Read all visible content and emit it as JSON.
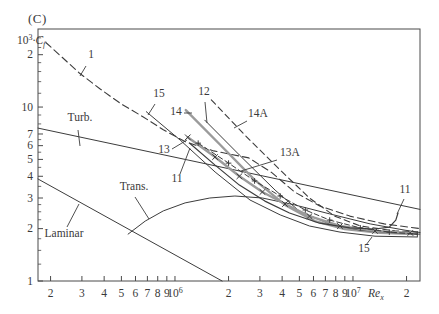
{
  "figure": {
    "corner_label": "(C)"
  },
  "chart_data": {
    "type": "line",
    "xlabel_parts": {
      "var": "Re",
      "sub": "x"
    },
    "ylabel_parts": {
      "pre": "10",
      "sup": "3",
      "mid": "·",
      "var": "C",
      "sub": "f"
    },
    "x_axis": {
      "scale": "log",
      "lim": [
        170000,
        23800000
      ],
      "ticks": [
        {
          "v": 200000,
          "label": "2"
        },
        {
          "v": 300000,
          "label": "3"
        },
        {
          "v": 400000,
          "label": "4"
        },
        {
          "v": 500000,
          "label": "5"
        },
        {
          "v": 600000,
          "label": "6"
        },
        {
          "v": 700000,
          "label": "7"
        },
        {
          "v": 800000,
          "label": "8"
        },
        {
          "v": 900000,
          "label": "9"
        },
        {
          "v": 1000000,
          "label": {
            "base": "10",
            "exp": "6"
          }
        },
        {
          "v": 2000000,
          "label": "2"
        },
        {
          "v": 3000000,
          "label": "3"
        },
        {
          "v": 4000000,
          "label": "4"
        },
        {
          "v": 5000000,
          "label": "5"
        },
        {
          "v": 6000000,
          "label": "6"
        },
        {
          "v": 7000000,
          "label": "7"
        },
        {
          "v": 8000000,
          "label": "8"
        },
        {
          "v": 9000000,
          "label": "9"
        },
        {
          "v": 10000000,
          "label": {
            "base": "10",
            "exp": "7"
          }
        },
        {
          "v": 20000000,
          "label": "2"
        }
      ]
    },
    "y_axis": {
      "scale": "log",
      "lim": [
        1,
        28.1
      ],
      "ticks": [
        {
          "v": 20,
          "label": "2"
        },
        {
          "v": 10,
          "label": "10"
        },
        {
          "v": 7,
          "label": "7"
        },
        {
          "v": 6,
          "label": "6"
        },
        {
          "v": 5,
          "label": "5"
        },
        {
          "v": 4,
          "label": "4"
        },
        {
          "v": 3,
          "label": "3"
        },
        {
          "v": 2,
          "label": "2"
        },
        {
          "v": 1,
          "label": "1"
        }
      ],
      "minor_ticks": [
        1.25,
        1.5,
        1.75,
        2.25,
        2.5,
        2.75,
        3.5,
        4.5,
        5.5,
        6.5,
        8,
        9,
        12,
        14,
        16,
        18,
        22,
        25
      ]
    },
    "colors": {
      "line": "#3c3c3c",
      "gray_line": "#9b9b9b",
      "text": "#3a3a3a",
      "frame": "#4a4a4a",
      "background": "#ffffff"
    },
    "series": [
      {
        "id": "1",
        "label": "1",
        "style": "dashed",
        "width": 1.1,
        "color": "line",
        "marker": null,
        "points": [
          [
            188000,
            23.5
          ],
          [
            230000,
            19.5
          ],
          [
            290000,
            15.7
          ],
          [
            380000,
            12.7
          ],
          [
            500000,
            10.4
          ],
          [
            660000,
            8.8
          ],
          [
            860000,
            7.4
          ],
          [
            1150000,
            6.3
          ],
          [
            1650000,
            5.6
          ],
          [
            2600000,
            5.1
          ],
          [
            3500000,
            4.2
          ],
          [
            4700000,
            3.25
          ],
          [
            6500000,
            2.7
          ],
          [
            9600000,
            2.36
          ],
          [
            15000000,
            2.13
          ],
          [
            23800000,
            2.0
          ]
        ]
      },
      {
        "id": "turb",
        "label": "Turb.",
        "style": "solid",
        "width": 1.0,
        "color": "line",
        "marker": null,
        "points": [
          [
            170000,
            7.57
          ],
          [
            23800000,
            2.58
          ]
        ]
      },
      {
        "id": "laminar",
        "label": "Laminar",
        "style": "solid",
        "width": 1.0,
        "color": "line",
        "marker": null,
        "points": [
          [
            170000,
            3.86
          ],
          [
            1840000,
            1.0
          ]
        ]
      },
      {
        "id": "trans",
        "label": "Trans.",
        "style": "solid",
        "width": 1.0,
        "color": "line",
        "marker": null,
        "points": [
          [
            545000,
            1.86
          ],
          [
            680000,
            2.21
          ],
          [
            860000,
            2.53
          ],
          [
            1140000,
            2.81
          ],
          [
            1570000,
            3.0
          ],
          [
            2170000,
            3.08
          ],
          [
            3100000,
            3.0
          ],
          [
            4700000,
            2.74
          ],
          [
            7400000,
            2.43
          ],
          [
            12500000,
            2.13
          ],
          [
            19600000,
            1.96
          ],
          [
            23800000,
            1.9
          ]
        ]
      },
      {
        "id": "15",
        "label": "15",
        "style": "solid",
        "width": 1.0,
        "color": "line",
        "marker": null,
        "points": [
          [
            690000,
            9.4
          ],
          [
            1070000,
            6.46
          ],
          [
            1680000,
            4.23
          ],
          [
            2640000,
            2.92
          ],
          [
            3900000,
            2.4
          ],
          [
            5700000,
            2.07
          ],
          [
            8450000,
            1.91
          ],
          [
            13300000,
            1.81
          ],
          [
            23000000,
            1.79
          ]
        ]
      },
      {
        "id": "14",
        "label": "14",
        "style": "solid",
        "width": 2.4,
        "color": "gray_line",
        "marker": null,
        "points": [
          [
            1150000,
            9.6
          ],
          [
            1800000,
            6.05
          ],
          [
            2800000,
            3.81
          ],
          [
            4150000,
            2.74
          ],
          [
            6100000,
            2.21
          ],
          [
            9000000,
            1.99
          ],
          [
            14200000,
            1.89
          ],
          [
            22000000,
            1.86
          ]
        ]
      },
      {
        "id": "12",
        "label": "12",
        "style": "solid",
        "width": 1.0,
        "color": "line",
        "marker": null,
        "points": [
          [
            1470000,
            8.4
          ],
          [
            2300000,
            5.3
          ],
          [
            3650000,
            3.33
          ],
          [
            5000000,
            2.52
          ],
          [
            7400000,
            2.13
          ],
          [
            11000000,
            1.96
          ],
          [
            17200000,
            1.89
          ],
          [
            23000000,
            1.86
          ]
        ]
      },
      {
        "id": "14A",
        "label": "14A",
        "style": "dashed",
        "width": 1.1,
        "color": "line",
        "marker": null,
        "points": [
          [
            1600000,
            11.0
          ],
          [
            2470000,
            6.9
          ],
          [
            3900000,
            4.34
          ],
          [
            5700000,
            3.0
          ],
          [
            7900000,
            2.36
          ],
          [
            11000000,
            2.07
          ],
          [
            17200000,
            1.94
          ],
          [
            23000000,
            1.91
          ]
        ]
      },
      {
        "id": "13",
        "label": "13",
        "style": "solid",
        "width": 2.4,
        "color": "gray_line",
        "marker": "x",
        "points": [
          [
            1180000,
            6.7
          ],
          [
            1680000,
            5.16
          ],
          [
            2300000,
            4.0
          ],
          [
            3100000,
            3.25
          ],
          [
            4150000,
            2.77
          ],
          [
            5700000,
            2.36
          ],
          [
            8450000,
            2.07
          ],
          [
            13300000,
            1.94
          ],
          [
            21000000,
            1.89
          ]
        ]
      },
      {
        "id": "13A",
        "label": "13A",
        "style": "dashed",
        "width": 1.0,
        "color": "line",
        "marker": "+",
        "points": [
          [
            1350000,
            6.2
          ],
          [
            2000000,
            4.76
          ],
          [
            2800000,
            3.76
          ],
          [
            3900000,
            3.08
          ],
          [
            5400000,
            2.56
          ],
          [
            7400000,
            2.24
          ],
          [
            11000000,
            2.02
          ],
          [
            16000000,
            1.91
          ],
          [
            23000000,
            1.86
          ]
        ]
      },
      {
        "id": "11",
        "label": "11",
        "style": "solid",
        "width": 1.2,
        "color": "line",
        "marker": null,
        "points": [
          [
            1210000,
            6.2
          ],
          [
            1680000,
            4.64
          ],
          [
            2300000,
            3.56
          ],
          [
            3200000,
            2.88
          ],
          [
            4400000,
            2.46
          ],
          [
            6500000,
            2.15
          ],
          [
            9600000,
            2.02
          ],
          [
            13300000,
            1.99
          ],
          [
            16000000,
            2.04
          ],
          [
            17400000,
            2.24
          ],
          [
            17900000,
            2.46
          ]
        ]
      }
    ],
    "annotations": [
      {
        "id": "1",
        "text": "1",
        "x": 91,
        "y": 58,
        "line": [
          86,
          66,
          80,
          76
        ]
      },
      {
        "id": "15-top",
        "text": "15",
        "x": 159,
        "y": 97,
        "line": [
          155,
          104,
          148,
          115
        ]
      },
      {
        "id": "12",
        "text": "12",
        "x": 204,
        "y": 95,
        "line": [
          205,
          102,
          207,
          123
        ]
      },
      {
        "id": "14",
        "text": "14",
        "x": 176,
        "y": 115,
        "line": [
          184,
          113,
          192,
          113
        ]
      },
      {
        "id": "14A",
        "text": "14A",
        "x": 258,
        "y": 117,
        "line": [
          247,
          121,
          234,
          128
        ]
      },
      {
        "id": "13",
        "text": "13",
        "x": 164,
        "y": 153,
        "line": [
          172,
          149,
          187,
          140
        ]
      },
      {
        "id": "13A",
        "text": "13A",
        "x": 290,
        "y": 156,
        "line": [
          277,
          160,
          241,
          171
        ]
      },
      {
        "id": "11-left",
        "text": "11",
        "x": 177,
        "y": 182,
        "line": [
          180,
          174,
          190,
          148
        ]
      },
      {
        "id": "11-right",
        "text": "11",
        "x": 405,
        "y": 193,
        "line": [
          404,
          199,
          397,
          214
        ]
      },
      {
        "id": "15-bot",
        "text": "15",
        "x": 364,
        "y": 252,
        "line": [
          366,
          245,
          372,
          237
        ]
      },
      {
        "id": "turb",
        "text": "Turb.",
        "x": 80,
        "y": 121,
        "line": [
          78,
          130,
          80,
          146
        ]
      },
      {
        "id": "trans",
        "text": "Trans.",
        "x": 134,
        "y": 190,
        "line": [
          135,
          197,
          149,
          219
        ]
      },
      {
        "id": "laminar",
        "text": "Laminar",
        "x": 64,
        "y": 237,
        "line": [
          67,
          227,
          79,
          204
        ]
      }
    ]
  }
}
